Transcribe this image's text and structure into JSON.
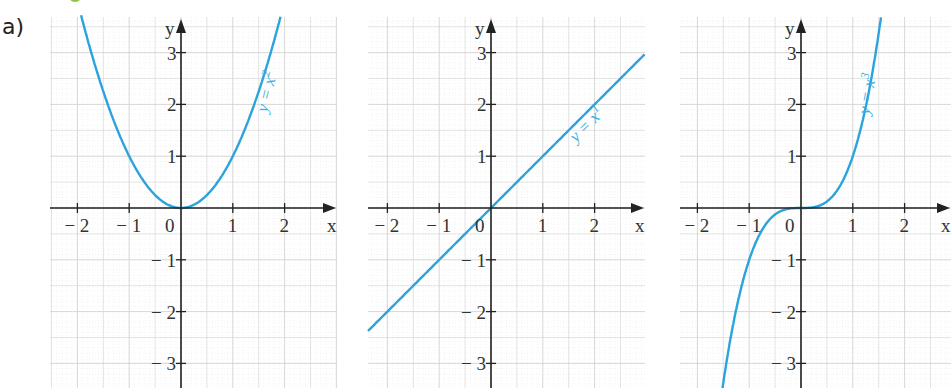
{
  "part_label": "a)",
  "colors": {
    "curve": "#2ba3dc",
    "axis": "#222222",
    "grid_major": "#d4d4d4",
    "grid_minor": "#ececec",
    "tick_text": "#333333",
    "accent_green": "#8cc63f"
  },
  "chart_data": [
    {
      "type": "line",
      "title": "",
      "function": "y = x^2",
      "curve_label": "y = x²",
      "xlabel": "x",
      "ylabel": "y",
      "xlim": [
        -2.5,
        3.0
      ],
      "ylim": [
        -3.5,
        3.6
      ],
      "x_ticks": [
        "-2",
        "-1",
        "0",
        "1",
        "2"
      ],
      "y_ticks": [
        "3",
        "2",
        "1",
        "-1",
        "-2",
        "-3"
      ],
      "grid": true,
      "points": [
        [
          -1.9,
          3.61
        ],
        [
          -1.5,
          2.25
        ],
        [
          -1,
          1
        ],
        [
          -0.5,
          0.25
        ],
        [
          0,
          0
        ],
        [
          0.5,
          0.25
        ],
        [
          1,
          1
        ],
        [
          1.5,
          2.25
        ],
        [
          1.9,
          3.61
        ]
      ]
    },
    {
      "type": "line",
      "title": "",
      "function": "y = x^1",
      "curve_label": "y = x¹",
      "xlabel": "x",
      "ylabel": "y",
      "xlim": [
        -2.4,
        3.0
      ],
      "ylim": [
        -3.5,
        3.6
      ],
      "x_ticks": [
        "-2",
        "-1",
        "0",
        "1",
        "2"
      ],
      "y_ticks": [
        "3",
        "2",
        "1",
        "-1",
        "-2",
        "-3"
      ],
      "grid": true,
      "points": [
        [
          -2.4,
          -2.4
        ],
        [
          0,
          0
        ],
        [
          2.94,
          2.94
        ]
      ]
    },
    {
      "type": "line",
      "title": "",
      "function": "y = x^3",
      "curve_label": "y = x³",
      "xlabel": "x",
      "ylabel": "y",
      "xlim": [
        -2.4,
        2.9
      ],
      "ylim": [
        -3.5,
        3.6
      ],
      "x_ticks": [
        "-2",
        "-1",
        "0",
        "1",
        "2"
      ],
      "y_ticks": [
        "3",
        "2",
        "1",
        "-1",
        "-2",
        "-3"
      ],
      "grid": true,
      "points": [
        [
          -1.58,
          -3.94
        ],
        [
          -1.5,
          -3.375
        ],
        [
          -1,
          -1
        ],
        [
          -0.5,
          -0.125
        ],
        [
          0,
          0
        ],
        [
          0.5,
          0.125
        ],
        [
          1,
          1
        ],
        [
          1.5,
          3.375
        ],
        [
          1.55,
          3.72
        ]
      ]
    }
  ],
  "graphs": [
    {
      "name": "graph-square",
      "origin_x": 181,
      "grid_left": 50,
      "grid_right": 337,
      "exponent": 2,
      "label_main": "y = x",
      "label_sup": "2",
      "x_label": "x",
      "y_label": "y",
      "zero_label": "0"
    },
    {
      "name": "graph-linear",
      "origin_x": 491,
      "grid_left": 368,
      "grid_right": 645,
      "exponent": 1,
      "label_main": "y = x",
      "label_sup": "1",
      "x_label": "x",
      "y_label": "y",
      "zero_label": "0"
    },
    {
      "name": "graph-cube",
      "origin_x": 801,
      "grid_left": 680,
      "grid_right": 951,
      "exponent": 3,
      "label_main": "y = x",
      "label_sup": "3",
      "x_label": "x",
      "y_label": "y",
      "zero_label": "0"
    }
  ],
  "layout": {
    "unit": 51.8,
    "origin_y": 208,
    "grid_top": 17,
    "grid_bottom": 388
  }
}
